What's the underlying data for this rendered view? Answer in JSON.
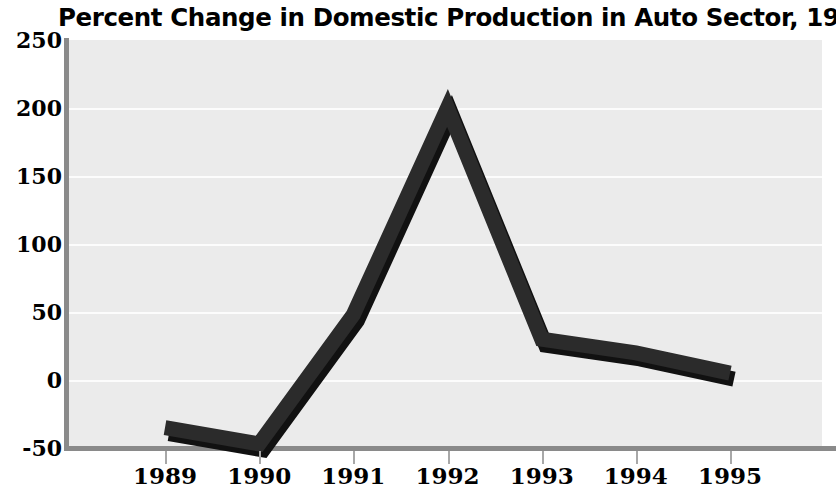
{
  "chart_data": {
    "type": "line",
    "title": "Percent Change in Domestic Production in Auto Sector, 1989-95",
    "xlabel": "",
    "ylabel": "",
    "categories": [
      "1989",
      "1990",
      "1991",
      "1992",
      "1993",
      "1994",
      "1995"
    ],
    "values": [
      -35,
      -47,
      48,
      200,
      30,
      20,
      5
    ],
    "series": [
      {
        "name": "Percent Change",
        "values": [
          -35,
          -47,
          48,
          200,
          30,
          20,
          5
        ]
      }
    ],
    "ylim": [
      -50,
      250
    ],
    "ytick_labels": [
      "250",
      "200",
      "150",
      "100",
      "50",
      "0",
      "-50"
    ],
    "ytick_values": [
      250,
      200,
      150,
      100,
      50,
      0,
      -50
    ],
    "xtick_labels": [
      "1989",
      "1990",
      "1991",
      "1992",
      "1993",
      "1994",
      "1995"
    ],
    "grid": true,
    "legend": "none",
    "colors": {
      "line": "#2b2b2b",
      "shadow": "#111111",
      "plot_background": "#ebebeb",
      "gridline": "#fcfcfc",
      "axis": "#8a8a8a",
      "text": "#000000",
      "figure_background": "#ffffff"
    }
  }
}
